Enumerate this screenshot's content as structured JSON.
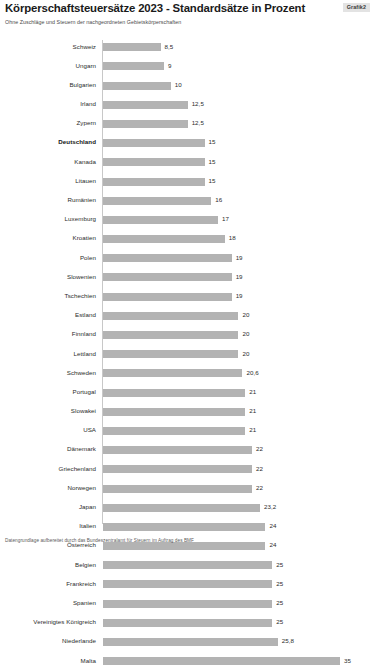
{
  "header": {
    "title": "Körperschaftsteuersätze 2023 - Standardsätze in Prozent",
    "badge": "Grafik2",
    "subtitle": "Ohne Zuschläge und Steuern der nachgeordneten Gebietskörperschaften"
  },
  "footer": {
    "note": "Datengrundlage aufbereitet durch das Bundeszentralamt für Steuern im Auftrag des BMF"
  },
  "chart_data": {
    "type": "bar",
    "orientation": "horizontal",
    "title": "Körperschaftsteuersätze 2023 - Standardsätze in Prozent",
    "subtitle": "Ohne Zuschläge und Steuern der nachgeordneten Gebietskörperschaften",
    "xlabel": "",
    "ylabel": "",
    "xlim": [
      0,
      35
    ],
    "grid": false,
    "legend": null,
    "bar_color": "#b3b3b3",
    "highlight_category": "Deutschland",
    "value_labels": true,
    "categories": [
      "Schweiz",
      "Ungarn",
      "Bulgarien",
      "Irland",
      "Zypern",
      "Deutschland",
      "Kanada",
      "Litauen",
      "Rumänien",
      "Luxemburg",
      "Kroatien",
      "Polen",
      "Slowenien",
      "Tschechien",
      "Estland",
      "Finnland",
      "Lettland",
      "Schweden",
      "Portugal",
      "Slowakei",
      "USA",
      "Dänemark",
      "Griechenland",
      "Norwegen",
      "Japan",
      "Italien",
      "Österreich",
      "Belgien",
      "Frankreich",
      "Spanien",
      "Vereinigtes Königreich",
      "Niederlande",
      "Malta"
    ],
    "values": [
      8.5,
      9,
      10,
      12.5,
      12.5,
      15,
      15,
      15,
      16,
      17,
      18,
      19,
      19,
      19,
      20,
      20,
      20,
      20.6,
      21,
      21,
      21,
      22,
      22,
      22,
      23.2,
      24,
      24,
      25,
      25,
      25,
      25,
      25.8,
      35
    ],
    "value_labels_text": [
      "8,5",
      "9",
      "10",
      "12,5",
      "12,5",
      "15",
      "15",
      "15",
      "16",
      "17",
      "18",
      "19",
      "19",
      "19",
      "20",
      "20",
      "20",
      "20,6",
      "21",
      "21",
      "21",
      "22",
      "22",
      "22",
      "23,2",
      "24",
      "24",
      "25",
      "25",
      "25",
      "25",
      "25,8",
      "35"
    ]
  }
}
